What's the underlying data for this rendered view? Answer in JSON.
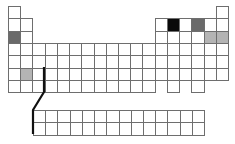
{
  "diagram": {
    "type": "periodic-table-outline",
    "origin_x": 8,
    "origin_y": 6,
    "cell_w": 12.22,
    "cell_h": 12.3,
    "colors": {
      "empty": "#ffffff",
      "border": "#6e6e6e",
      "black": "#0a0a0a",
      "dark_gray": "#6a6a6a",
      "light_gray": "#b4b4b4",
      "connector": "#111111"
    },
    "main_rows": [
      {
        "row": 1,
        "cols": [
          1,
          18
        ]
      },
      {
        "row": 2,
        "cols": [
          1,
          2,
          13,
          14,
          15,
          16,
          17,
          18
        ]
      },
      {
        "row": 3,
        "cols": [
          1,
          2,
          13,
          14,
          15,
          16,
          17,
          18
        ]
      },
      {
        "row": 4,
        "cols": [
          1,
          2,
          3,
          4,
          5,
          6,
          7,
          8,
          9,
          10,
          11,
          12,
          13,
          14,
          15,
          16,
          17,
          18
        ]
      },
      {
        "row": 5,
        "cols": [
          1,
          2,
          3,
          4,
          5,
          6,
          7,
          8,
          9,
          10,
          11,
          12,
          13,
          14,
          15,
          16,
          17,
          18
        ]
      },
      {
        "row": 6,
        "cols": [
          1,
          2,
          3,
          4,
          5,
          6,
          7,
          8,
          9,
          10,
          11,
          12,
          13,
          14,
          15,
          16,
          17,
          18
        ]
      },
      {
        "row": 7,
        "cols": [
          1,
          2,
          3,
          4,
          5,
          6,
          7,
          8,
          9,
          10,
          11,
          12,
          14,
          16
        ]
      }
    ],
    "highlighted": [
      {
        "row": 3,
        "col": 1,
        "shade": "dark_gray"
      },
      {
        "row": 2,
        "col": 14,
        "shade": "black"
      },
      {
        "row": 2,
        "col": 16,
        "shade": "dark_gray"
      },
      {
        "row": 3,
        "col": 17,
        "shade": "light_gray"
      },
      {
        "row": 3,
        "col": 18,
        "shade": "light_gray"
      },
      {
        "row": 6,
        "col": 2,
        "shade": "light_gray"
      }
    ],
    "f_block": {
      "x": 33,
      "y": 110,
      "rows": 2,
      "cols": 14
    },
    "connector_points": [
      [
        44,
        67
      ],
      [
        44,
        92
      ],
      [
        33,
        110
      ],
      [
        33,
        134
      ]
    ]
  }
}
